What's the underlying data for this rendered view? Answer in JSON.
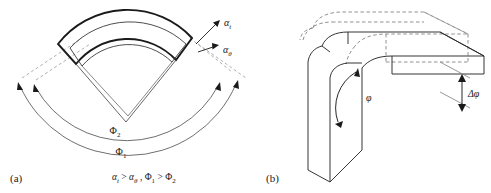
{
  "figure": {
    "type": "technical-diagram",
    "background": "#ffffff",
    "line_color": "#1a1a1a",
    "dashed_color": "#8d8d8d",
    "panels": [
      {
        "tag": "(a)",
        "name": "annular-sector-springback",
        "description": "Two nested annular sectors showing angular springback of a curved band",
        "labels": {
          "alpha_t": "α",
          "alpha_t_sub": "t",
          "alpha_theta": "α",
          "alpha_theta_sub": "θ",
          "phi_1": "Φ",
          "phi_1_sub": "1",
          "phi_2": "Φ",
          "phi_2_sub": "2"
        },
        "caption": {
          "part1": "α",
          "part1_sub": "t",
          "gt1": " > ",
          "part2": "α",
          "part2_sub": "θ",
          "comma": " , ",
          "part3": "Φ",
          "part3_sub": "1",
          "gt2": " > ",
          "part4": "Φ",
          "part4_sub": "2"
        }
      },
      {
        "tag": "(b)",
        "name": "bent-beam-springback",
        "description": "Three-dimensional bent beam with dashed undeformed outline and solid deformed body",
        "labels": {
          "phi": "φ",
          "delta_phi": "Δφ"
        }
      }
    ]
  }
}
